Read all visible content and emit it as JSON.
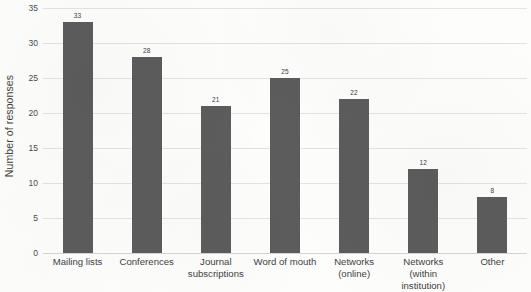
{
  "chart_data": {
    "type": "bar",
    "title": "",
    "xlabel": "",
    "ylabel": "Number of responses",
    "ylim": [
      0,
      35
    ],
    "ytick_step": 5,
    "yticks": [
      "0",
      "5",
      "10",
      "15",
      "20",
      "25",
      "30",
      "35"
    ],
    "grid": true,
    "legend": "none",
    "categories": [
      "Mailing lists",
      "Conferences",
      "Journal subscriptions",
      "Word of mouth",
      "Networks (online)",
      "Networks (within institution)",
      "Other"
    ],
    "values": [
      33,
      28,
      21,
      25,
      22,
      12,
      8
    ],
    "value_labels": [
      "33",
      "28",
      "21",
      "25",
      "22",
      "12",
      "8"
    ],
    "bar_color": "#5c5c5c",
    "grid_color": "#e3e3e3",
    "background_color": "#fdfdfc",
    "text_color": "#3f3f3f"
  }
}
